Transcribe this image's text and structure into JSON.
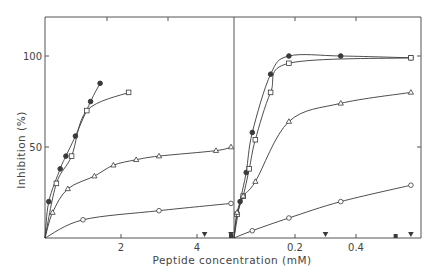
{
  "chart_data": {
    "type": "line",
    "title": "",
    "ylabel": "Inhibition (%)",
    "xlabel": "Peptide concentration (mM)",
    "ylim": [
      0,
      120
    ],
    "yticks": [
      50,
      100
    ],
    "ytick_labels": [
      "50",
      "100"
    ],
    "grid": false,
    "legend": "none",
    "panels": [
      {
        "name": "left",
        "xlim": [
          0,
          5
        ],
        "xticks": [
          2,
          4
        ],
        "xtick_labels": [
          "2",
          "4"
        ],
        "series": [
          {
            "name": "filled-circle",
            "marker": "filled-circle",
            "x": [
              0,
              0.1,
              0.4,
              0.55,
              0.8,
              1.2,
              1.45
            ],
            "y": [
              0,
              20,
              38,
              45,
              56,
              75,
              85
            ]
          },
          {
            "name": "open-square",
            "marker": "open-square",
            "x": [
              0,
              0.3,
              0.7,
              1.1,
              2.2
            ],
            "y": [
              0,
              30,
              45,
              70,
              80
            ]
          },
          {
            "name": "open-triangle",
            "marker": "open-triangle",
            "x": [
              0,
              0.2,
              0.6,
              1.3,
              1.8,
              2.4,
              3.0,
              4.5,
              6.0
            ],
            "y": [
              0,
              14,
              27,
              34,
              40,
              43,
              45,
              48,
              50
            ]
          },
          {
            "name": "open-circle",
            "marker": "open-circle",
            "x": [
              0,
              1.0,
              3.0,
              6.0
            ],
            "y": [
              0,
              10,
              15,
              19
            ]
          },
          {
            "name": "inactive-triangle-down",
            "marker": "filled-triangle-down",
            "x": [
              4.2,
              6.0
            ],
            "y": [
              0,
              0
            ]
          },
          {
            "name": "inactive-square",
            "marker": "filled-square",
            "x": [
              5.3
            ],
            "y": [
              0
            ]
          }
        ]
      },
      {
        "name": "right",
        "xlim": [
          0,
          0.6
        ],
        "xticks": [
          0.2,
          0.4
        ],
        "xtick_labels": [
          "0.2",
          "0.4"
        ],
        "series": [
          {
            "name": "filled-circle",
            "marker": "filled-circle",
            "x": [
              0,
              0.02,
              0.04,
              0.06,
              0.12,
              0.18,
              0.35,
              0.58
            ],
            "y": [
              0,
              20,
              36,
              58,
              90,
              100,
              100,
              99
            ]
          },
          {
            "name": "open-square",
            "marker": "open-square",
            "x": [
              0,
              0.01,
              0.03,
              0.05,
              0.07,
              0.12,
              0.18,
              0.58
            ],
            "y": [
              0,
              13,
              23,
              38,
              54,
              80,
              96,
              99
            ]
          },
          {
            "name": "open-triangle",
            "marker": "open-triangle",
            "x": [
              0,
              0.01,
              0.03,
              0.07,
              0.18,
              0.35,
              0.58
            ],
            "y": [
              0,
              14,
              23,
              31,
              64,
              74,
              80
            ]
          },
          {
            "name": "open-circle",
            "marker": "open-circle",
            "x": [
              0,
              0.06,
              0.18,
              0.35,
              0.58
            ],
            "y": [
              0,
              4,
              11,
              20,
              29
            ]
          },
          {
            "name": "inactive-triangle-down",
            "marker": "filled-triangle-down",
            "x": [
              0.3,
              0.58
            ],
            "y": [
              0,
              0
            ]
          },
          {
            "name": "inactive-square",
            "marker": "filled-square",
            "x": [
              0.53
            ],
            "y": [
              0
            ]
          }
        ]
      }
    ]
  },
  "labels": {
    "ylabel": "Inhibition (%)",
    "xlabel": "Peptide concentration (mM)",
    "ytick_100": "100",
    "ytick_50": "50",
    "left_xtick_2": "2",
    "left_xtick_4": "4",
    "right_xtick_02": "0.2",
    "right_xtick_04": "0.4"
  },
  "style": {
    "line_color": "#3a3a3a",
    "axis_color": "#555555",
    "background": "#ffffff"
  }
}
